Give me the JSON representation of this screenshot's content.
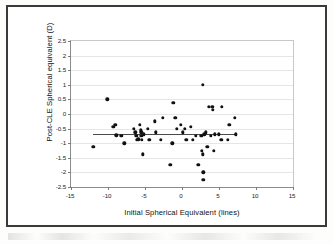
{
  "figure": {
    "kind": "scatter-plot-figure",
    "border_color": "#3a3a3a",
    "background": "#ffffff"
  },
  "chart_data": {
    "type": "scatter",
    "title": "",
    "xlabel": "Initial Spherical Equivalent (lines)",
    "ylabel": "Post-CLE Spherical equivalent (D)",
    "xlim": [
      -15,
      15
    ],
    "ylim": [
      -2.5,
      2.5
    ],
    "xticks": [
      -15,
      -10,
      -5,
      0,
      5,
      10,
      15
    ],
    "xtick_labels": [
      "-15",
      "-10",
      "-5",
      "0",
      "5",
      "10",
      "15"
    ],
    "yticks": [
      -2.5,
      -2,
      -1.5,
      -1,
      -0.5,
      0,
      0.5,
      1,
      1.5,
      2,
      2.5
    ],
    "ytick_labels": [
      "-2.5",
      "-2",
      "-1.5",
      "-1",
      "-0.5",
      "0",
      "0.5",
      "1",
      "1.5",
      "2",
      "2.5"
    ],
    "grid": "horizontal",
    "grid_color": "#e6e6e6",
    "legend": "none",
    "marker": {
      "shape": "circle",
      "color": "#111111",
      "size": 3.4
    },
    "points": [
      [
        -12.0,
        -1.13
      ],
      [
        -10.1,
        0.5
      ],
      [
        -9.3,
        -0.44
      ],
      [
        -9.0,
        -0.38
      ],
      [
        -8.9,
        -0.73
      ],
      [
        -8.2,
        -0.75
      ],
      [
        -7.8,
        -1.0
      ],
      [
        -6.5,
        -0.5
      ],
      [
        -6.3,
        -0.63
      ],
      [
        -6.2,
        -0.75
      ],
      [
        -6.1,
        -0.88
      ],
      [
        -5.9,
        -0.86
      ],
      [
        -5.7,
        -0.38
      ],
      [
        -5.6,
        -0.56
      ],
      [
        -5.5,
        -0.63
      ],
      [
        -5.5,
        -0.75
      ],
      [
        -5.4,
        -0.88
      ],
      [
        -5.3,
        -1.38
      ],
      [
        -5.2,
        -0.7
      ],
      [
        -4.6,
        -0.5
      ],
      [
        -4.4,
        -0.88
      ],
      [
        -3.7,
        -0.25
      ],
      [
        -3.5,
        -0.63
      ],
      [
        -2.9,
        -0.88
      ],
      [
        -2.6,
        -0.13
      ],
      [
        -1.6,
        -1.75
      ],
      [
        -1.3,
        -1.0
      ],
      [
        -1.2,
        0.38
      ],
      [
        -0.9,
        -0.13
      ],
      [
        -0.7,
        -0.5
      ],
      [
        -0.2,
        -0.38
      ],
      [
        0.1,
        -0.63
      ],
      [
        0.4,
        -0.5
      ],
      [
        0.6,
        -0.88
      ],
      [
        1.2,
        -0.44
      ],
      [
        1.5,
        -0.88
      ],
      [
        1.9,
        -0.75
      ],
      [
        2.2,
        -1.75
      ],
      [
        2.6,
        -0.75
      ],
      [
        2.7,
        -1.25
      ],
      [
        2.8,
        -1.38
      ],
      [
        2.8,
        1.0
      ],
      [
        2.9,
        -2.0
      ],
      [
        2.9,
        -2.25
      ],
      [
        3.0,
        -0.7
      ],
      [
        3.2,
        -0.63
      ],
      [
        3.4,
        -1.13
      ],
      [
        3.6,
        0.25
      ],
      [
        3.9,
        -0.75
      ],
      [
        4.1,
        0.25
      ],
      [
        4.2,
        0.15
      ],
      [
        4.3,
        -1.25
      ],
      [
        4.4,
        -0.7
      ],
      [
        5.0,
        -0.7
      ],
      [
        5.3,
        -0.88
      ],
      [
        5.4,
        0.25
      ],
      [
        6.2,
        -0.88
      ],
      [
        6.4,
        -0.38
      ],
      [
        7.1,
        -0.13
      ],
      [
        7.3,
        -0.7
      ]
    ],
    "trendline": {
      "label": "linear fit",
      "color": "#4a4a4a",
      "x_start": -12.0,
      "x_end": 7.5,
      "y_start": -0.68,
      "y_end": -0.68
    }
  }
}
